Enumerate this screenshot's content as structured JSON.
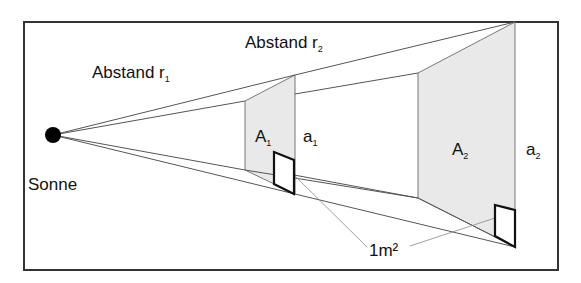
{
  "diagram": {
    "labels": {
      "distance1": "Abstand r",
      "distance1_sub": "1",
      "distance2": "Abstand r",
      "distance2_sub": "2",
      "sun": "Sonne",
      "area1": "A",
      "area1_sub": "1",
      "side1": "a",
      "side1_sub": "1",
      "area2": "A",
      "area2_sub": "2",
      "side2": "a",
      "side2_sub": "2",
      "unit_square": "1m²"
    },
    "colors": {
      "frame": "#333333",
      "lines": "#555555",
      "panel_fill": "#e9e9e9",
      "square_stroke": "#111111",
      "sun": "#000000"
    }
  }
}
